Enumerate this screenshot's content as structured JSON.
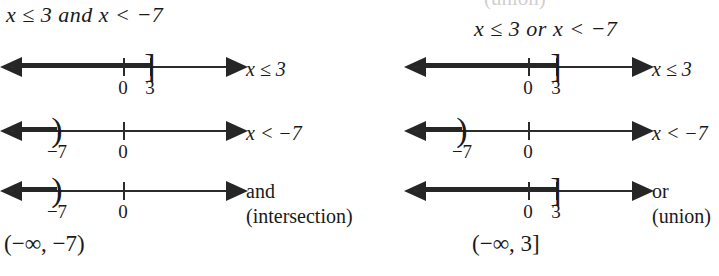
{
  "figure": {
    "title_left": "x ≤ 3 and x < −7",
    "title_right": "x ≤ 3 or x < −7",
    "clipped_top_text": "(union)"
  },
  "columns": [
    {
      "id": "and-column",
      "heading_lhs": "x ≤ 3 ",
      "heading_op": "and",
      "heading_rhs": " x < −7",
      "interval_notation": "(−∞, −7)",
      "rows": [
        {
          "id": "row-x-le-3",
          "label": "x ≤ 3",
          "label2": "",
          "ticks": [
            {
              "value": "0",
              "pos": 123
            },
            {
              "value": "3",
              "pos": 150
            }
          ],
          "endpoint": "]",
          "endpoint_pos": 150,
          "shade_from": 14,
          "shade_to": 150
        },
        {
          "id": "row-x-lt-neg7",
          "label": "x < −7",
          "label2": "",
          "ticks": [
            {
              "value": "−7",
              "pos": 57
            },
            {
              "value": "0",
              "pos": 123
            }
          ],
          "endpoint": ")",
          "endpoint_pos": 57,
          "shade_from": 14,
          "shade_to": 57
        },
        {
          "id": "row-intersection",
          "label": "and",
          "label2": "(intersection)",
          "ticks": [
            {
              "value": "−7",
              "pos": 57
            },
            {
              "value": "0",
              "pos": 123
            }
          ],
          "endpoint": ")",
          "endpoint_pos": 57,
          "shade_from": 14,
          "shade_to": 57
        }
      ]
    },
    {
      "id": "or-column",
      "heading_lhs": "x ≤ 3 ",
      "heading_op": "or",
      "heading_rhs": " x < −7",
      "interval_notation": "(−∞, 3]",
      "rows": [
        {
          "id": "row-x-le-3",
          "label": "x ≤ 3",
          "label2": "",
          "ticks": [
            {
              "value": "0",
              "pos": 148
            },
            {
              "value": "3",
              "pos": 176
            }
          ],
          "endpoint": "]",
          "endpoint_pos": 176,
          "shade_from": 38,
          "shade_to": 176
        },
        {
          "id": "row-x-lt-neg7",
          "label": "x < −7",
          "label2": "",
          "ticks": [
            {
              "value": "−7",
              "pos": 82
            },
            {
              "value": "0",
              "pos": 148
            }
          ],
          "endpoint": ")",
          "endpoint_pos": 82,
          "shade_from": 38,
          "shade_to": 82
        },
        {
          "id": "row-union",
          "label": "or",
          "label2": "(union)",
          "ticks": [
            {
              "value": "0",
              "pos": 148
            },
            {
              "value": "3",
              "pos": 176
            }
          ],
          "endpoint": "]",
          "endpoint_pos": 176,
          "shade_from": 38,
          "shade_to": 176
        }
      ]
    }
  ],
  "geometry": {
    "row_tops": [
      48,
      112,
      172
    ],
    "left_axis": {
      "start": 10,
      "end": 226
    },
    "right_axis": {
      "start": 34,
      "end": 252
    }
  }
}
